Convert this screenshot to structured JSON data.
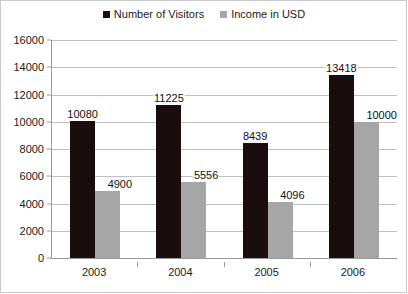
{
  "chart_data": {
    "type": "bar",
    "title": "",
    "xlabel": "",
    "ylabel": "",
    "categories": [
      "2003",
      "2004",
      "2005",
      "2006"
    ],
    "series": [
      {
        "name": "Number of Visitors",
        "color": "#1a0d0d",
        "values": [
          10080,
          11225,
          8439,
          13418
        ]
      },
      {
        "name": "Income in USD",
        "color": "#a6a6a6",
        "values": [
          4900,
          5556,
          4096,
          10000
        ]
      }
    ],
    "ylim": [
      0,
      16000
    ],
    "ytick_step": 2000,
    "yticks": [
      "0",
      "2000",
      "4000",
      "6000",
      "8000",
      "10000",
      "12000",
      "14000",
      "16000"
    ],
    "grid": true,
    "legend_position": "top-center",
    "data_labels": true,
    "background_color": "#ffffff",
    "gridline_color": "#bfbfbf",
    "axis_color": "#9a9a9a"
  },
  "legend": {
    "items": [
      {
        "label": "Number of Visitors",
        "swatch": "legend-swatch-visitors"
      },
      {
        "label": "Income in USD",
        "swatch": "legend-swatch-income"
      }
    ]
  }
}
